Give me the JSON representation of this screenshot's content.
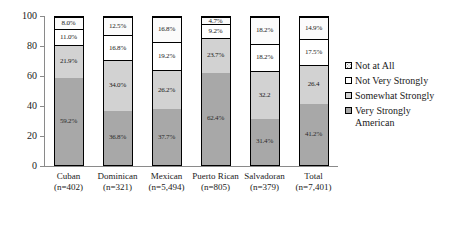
{
  "chart_data": {
    "type": "bar",
    "subtype": "stacked-bar-100",
    "title": "",
    "xlabel": "",
    "ylabel": "",
    "ylim": [
      0,
      100
    ],
    "yticks": [
      0,
      20,
      40,
      60,
      80,
      100
    ],
    "grid": false,
    "legend_position": "right",
    "categories": [
      "Cuban",
      "Dominican",
      "Mexican",
      "Puerto Rican",
      "Salvadoran",
      "Total"
    ],
    "category_counts": [
      "(n=402)",
      "(n=321)",
      "(n=5,494)",
      "(n=805)",
      "(n=379)",
      "(n=7,401)"
    ],
    "series": [
      {
        "name": "Very Strongly American",
        "color": "#a8a8a8",
        "values": [
          59.2,
          36.8,
          37.7,
          62.4,
          31.4,
          41.2
        ],
        "labels": [
          "59.2%",
          "36.8%",
          "37.7%",
          "62.4%",
          "31.4%",
          "41.2%"
        ]
      },
      {
        "name": "Somewhat Strongly",
        "color": "#d2d2d2",
        "values": [
          21.9,
          34.0,
          26.2,
          23.7,
          32.2,
          26.4
        ],
        "labels": [
          "21.9%",
          "34.0%",
          "26.2%",
          "23.7%",
          "32.2",
          "26.4"
        ]
      },
      {
        "name": "Not Very Strongly",
        "color": "#ffffff",
        "values": [
          11.0,
          16.8,
          19.2,
          9.2,
          18.2,
          17.5
        ],
        "labels": [
          "11.0%",
          "16.8%",
          "19.2%",
          "9.2%",
          "18.2%",
          "17.5%"
        ]
      },
      {
        "name": "Not at All",
        "color": "#fbfbfb",
        "pattern": "dotted",
        "values": [
          8.0,
          12.5,
          16.8,
          4.7,
          18.2,
          14.9
        ],
        "labels": [
          "8.0%",
          "12.5%",
          "16.8%",
          "4.7%",
          "18.2%",
          "14.9%"
        ]
      }
    ],
    "legend": [
      {
        "label": "Not at All",
        "swatch": "notatall"
      },
      {
        "label": "Not Very Strongly",
        "swatch": "notvery"
      },
      {
        "label": "Somewhat Strongly",
        "swatch": "somewhat"
      },
      {
        "label": "Very Strongly\nAmerican",
        "swatch": "verystrong"
      }
    ]
  }
}
